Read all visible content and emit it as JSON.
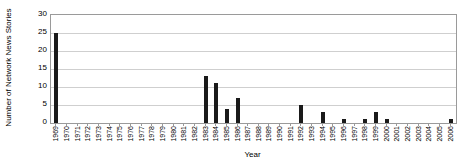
{
  "chart_data": {
    "type": "bar",
    "title": "",
    "xlabel": "Year",
    "ylabel": "Number of Network News Stories",
    "ylim": [
      0,
      30
    ],
    "ytick_labels": [
      "30",
      "25",
      "20",
      "15",
      "10",
      "5",
      "0"
    ],
    "ytick_values": [
      30,
      25,
      20,
      15,
      10,
      5,
      0
    ],
    "grid": "horizontal",
    "legend": "none",
    "bar_color": "#1a1a1a",
    "categories": [
      "1969",
      "1970",
      "1971",
      "1972",
      "1973",
      "1974",
      "1975",
      "1976",
      "1977",
      "1978",
      "1979",
      "1980",
      "1981",
      "1982",
      "1983",
      "1984",
      "1985",
      "1986",
      "1987",
      "1988",
      "1989",
      "1990",
      "1991",
      "1992",
      "1993",
      "1994",
      "1995",
      "1996",
      "1997",
      "1998",
      "1999",
      "2000",
      "2001",
      "2002",
      "2003",
      "2004",
      "2005",
      "2006"
    ],
    "values": [
      25,
      0,
      0,
      0,
      0,
      0,
      0,
      0,
      0,
      0,
      0,
      0,
      0,
      0,
      13,
      11,
      4,
      7,
      0,
      0,
      0,
      0,
      0,
      5,
      0,
      3,
      0,
      1,
      0,
      1,
      3,
      1,
      0,
      0,
      0,
      0,
      0,
      1
    ]
  }
}
